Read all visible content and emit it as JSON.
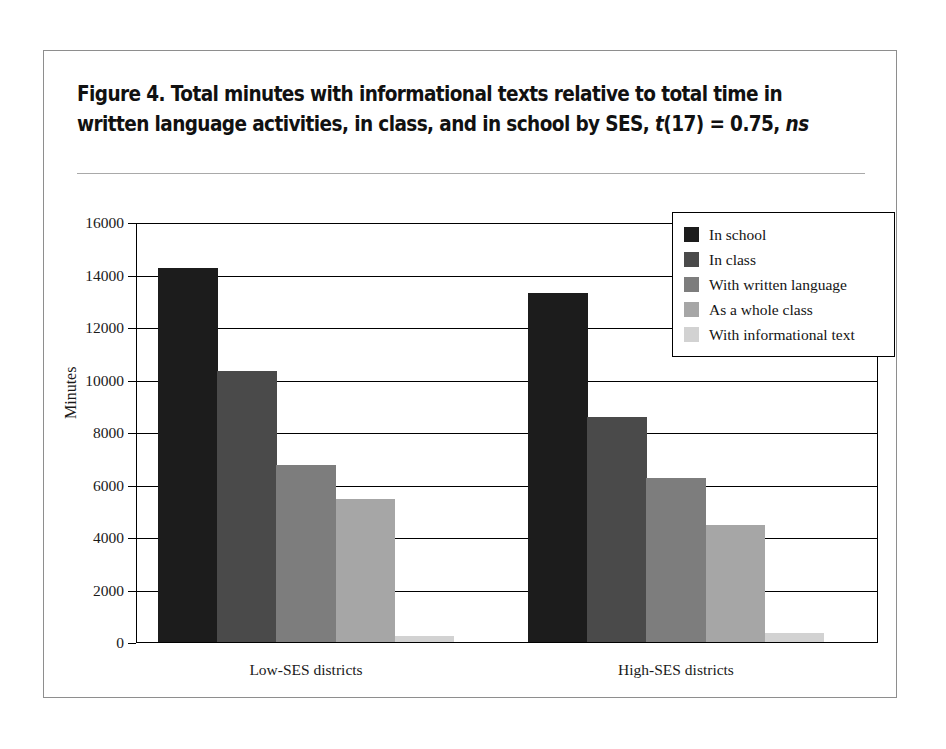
{
  "figure": {
    "title_line1": "Figure 4.  Total minutes with informational texts relative to total time in",
    "title_line2_a": "written language activities, in class, and in school by SES, ",
    "title_line2_t": "t",
    "title_line2_b": "(17) = 0.75, ",
    "title_line2_ns": "ns"
  },
  "chart_data": {
    "type": "bar",
    "title": "Figure 4. Total minutes with informational texts relative to total time in written language activities, in class, and in school by SES, t(17) = 0.75, ns",
    "xlabel": "",
    "ylabel": "Minutes",
    "ylim": [
      0,
      16000
    ],
    "yticks": [
      0,
      2000,
      4000,
      6000,
      8000,
      10000,
      12000,
      14000,
      16000
    ],
    "ytick_labels": [
      "0",
      "2000",
      "4000",
      "6000",
      "8000",
      "10000",
      "12000",
      "14000",
      "16000"
    ],
    "grid": true,
    "legend_position": "top-right",
    "categories": [
      "Low-SES districts",
      "High-SES districts"
    ],
    "series": [
      {
        "name": "In school",
        "color": "#1c1c1c",
        "values": [
          14300,
          13350
        ]
      },
      {
        "name": "In class",
        "color": "#4a4a4a",
        "values": [
          10350,
          8600
        ]
      },
      {
        "name": "With written language",
        "color": "#7d7d7d",
        "values": [
          6800,
          6300
        ]
      },
      {
        "name": "As a whole class",
        "color": "#a6a6a6",
        "values": [
          5500,
          4500
        ]
      },
      {
        "name": "With informational text",
        "color": "#d2d2d2",
        "values": [
          250,
          400
        ]
      }
    ]
  }
}
